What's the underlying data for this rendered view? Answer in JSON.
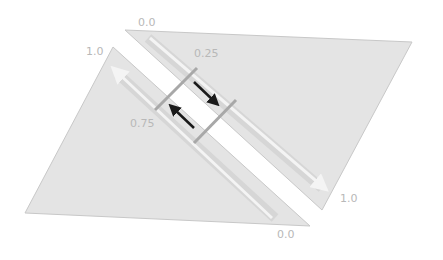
{
  "diagram": {
    "labels": {
      "top_start": "0.0",
      "top_end": "1.0",
      "bottom_start": "1.0",
      "bottom_end": "0.0",
      "top_mark": "0.25",
      "bottom_mark": "0.75"
    },
    "colors": {
      "surface": "#e4e4e4",
      "surface_edge": "#c8c8c8",
      "gutter": "#ffffff",
      "guide_arrow": "#f4f4f4",
      "connector": "#a8a8a8",
      "flow_arrow": "#1a1a1a",
      "label": "#b8b8b8"
    }
  }
}
